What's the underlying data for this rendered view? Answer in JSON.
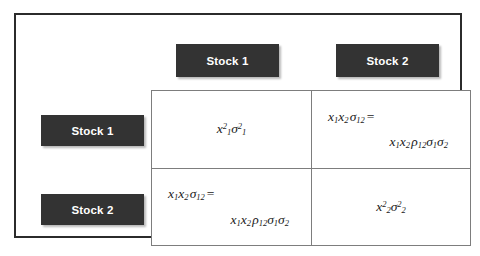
{
  "figure": {
    "colors": {
      "chip_background": "#333333",
      "chip_text": "#ffffff",
      "frame_border": "#2b2b2b",
      "matrix_border": "#7d7d7d",
      "page_background": "#ffffff"
    }
  },
  "column_headers": [
    {
      "label": "Stock 1"
    },
    {
      "label": "Stock 2"
    }
  ],
  "row_headers": [
    {
      "label": "Stock 1"
    },
    {
      "label": "Stock 2"
    }
  ],
  "matrix": {
    "cells": [
      {
        "row": "Stock 1",
        "column": "Stock 1",
        "kind": "variance",
        "line1": "x₁²σ₁²",
        "parts": {
          "x": "x",
          "x_sub": "1",
          "x_sup": "2",
          "sigma": "σ",
          "sigma_sub": "1",
          "sigma_sup": "2"
        }
      },
      {
        "row": "Stock 1",
        "column": "Stock 2",
        "kind": "covariance",
        "line1": "x₁x₂σ₁₂ =",
        "line2": "x₁x₂ρ₁₂σ₁σ₂"
      },
      {
        "row": "Stock 2",
        "column": "Stock 1",
        "kind": "covariance",
        "line1": "x₁x₂σ₁₂ =",
        "line2": "x₁x₂ρ₁₂σ₁σ₂"
      },
      {
        "row": "Stock 2",
        "column": "Stock 2",
        "kind": "variance",
        "line1": "x₂²σ₂²",
        "parts": {
          "x": "x",
          "x_sub": "2",
          "x_sup": "2",
          "sigma": "σ",
          "sigma_sub": "2",
          "sigma_sup": "2"
        }
      }
    ],
    "symbols": {
      "weight": "x",
      "sigma": "σ",
      "rho": "ρ",
      "equals": "=",
      "sub_1": "1",
      "sub_2": "2",
      "sub_12": "12",
      "sup_2": "2"
    }
  }
}
